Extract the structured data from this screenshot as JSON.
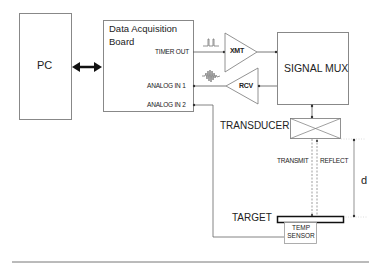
{
  "diagram": {
    "pc": {
      "label": "PC"
    },
    "daq": {
      "title_line1": "Data Acquisition",
      "title_line2": "Board",
      "ports": {
        "timer_out": "TIMER OUT",
        "analog_in_1": "ANALOG  IN 1",
        "analog_in_2": "ANALOG  IN 2"
      }
    },
    "amplifiers": {
      "transmit": "XMT",
      "receive": "RCV"
    },
    "signal_mux": {
      "label": "SIGNAL MUX"
    },
    "transducer": {
      "label": "TRANSDUCER"
    },
    "beam": {
      "transmit_label": "TRANSMIT",
      "reflect_label": "REFLECT"
    },
    "distance": {
      "label": "d"
    },
    "target": {
      "label": "TARGET"
    },
    "temp_sensor": {
      "line1": "TEMP",
      "line2": "SENSOR"
    },
    "icons": {
      "pulse": "pulse-train-icon",
      "echo": "echo-wavelet-icon",
      "bidirectional": "double-arrow-icon"
    },
    "colors": {
      "line": "#555555",
      "arrow": "#111111",
      "background": "#ffffff"
    }
  }
}
